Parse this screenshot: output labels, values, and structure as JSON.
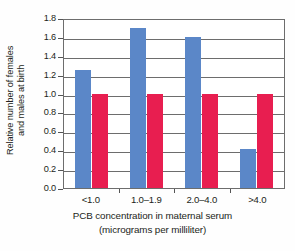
{
  "chart_data": {
    "type": "bar",
    "title": "",
    "xlabel": "PCB concentration in maternal serum (micrograms per milliliter)",
    "xlabel_lines": [
      "PCB concentration in maternal serum",
      "(micrograms per milliliter)"
    ],
    "ylabel": "Relative number of females and males at birth",
    "ylabel_lines": [
      "Relative number of females",
      "and males at birth"
    ],
    "categories": [
      "<1.0",
      "1.0–1.9",
      "2.0–4.0",
      ">4.0"
    ],
    "series": [
      {
        "name": "females",
        "color": "#5b87c8",
        "values": [
          1.25,
          1.69,
          1.6,
          0.41
        ]
      },
      {
        "name": "males",
        "color": "#e81e50",
        "values": [
          1.0,
          1.0,
          1.0,
          1.0
        ]
      }
    ],
    "ylim": [
      0.0,
      1.8
    ],
    "ytick_labels": [
      "1.8",
      "1.6",
      "1.4",
      "1.2",
      "1.0",
      "0.8",
      "0.6",
      "0.4",
      "0.2",
      "0.0"
    ],
    "ytick_values": [
      1.8,
      1.6,
      1.4,
      1.2,
      1.0,
      0.8,
      0.6,
      0.4,
      0.2,
      0.0
    ],
    "ytick_step": 0.2,
    "grid": true,
    "grid_axis": "y",
    "legend": false,
    "legend_position": "none",
    "frame": true,
    "colors": {
      "blue": "#5b87c8",
      "red": "#e81e50",
      "axis": "#6d6d6d",
      "text": "#231f20",
      "background": "#fefefe",
      "plot_background": "#ffffff"
    }
  }
}
